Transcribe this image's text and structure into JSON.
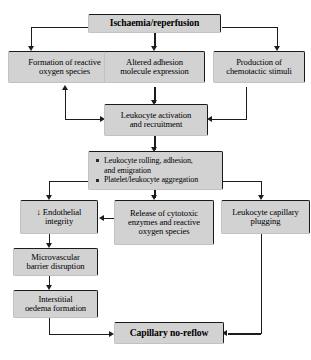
{
  "diagram": {
    "colors": {
      "box_fill": "#d2d2d2",
      "box_edge": "#1a1a1a",
      "connector": "#1c1c1c",
      "background": "#ffffff"
    },
    "nodes": {
      "ischaemia": {
        "label": "Ischaemia/reperfusion"
      },
      "reactive_oxygen": {
        "line1": "Formation of reactive",
        "line2": "oxygen species"
      },
      "adhesion": {
        "line1": "Altered adhesion",
        "line2": "molecule expression"
      },
      "chemotactic": {
        "line1": "Production of",
        "line2": "chemotactic stimuli"
      },
      "leukocyte_activation": {
        "line1": "Leukocyte activation",
        "line2": "and recruitment"
      },
      "rolling": {
        "bullets": [
          "Leukocyte rolling, adhesion,",
          "and emigration",
          "Platelet/leukocyte aggregation"
        ],
        "bullet_items": [
          {
            "line1": "Leukocyte rolling, adhesion,",
            "line2": "and emigration"
          },
          {
            "line1": "Platelet/leukocyte aggregation",
            "line2": ""
          }
        ]
      },
      "endothelial": {
        "line1": "↓ Endothelial",
        "line2": "integrity"
      },
      "cytotoxic": {
        "line1": "Release of cytotoxic",
        "line2": "enzymes and reactive",
        "line3": "oxygen species"
      },
      "plugging": {
        "line1": "Leukocyte capillary",
        "line2": "plugging"
      },
      "microvascular": {
        "line1": "Microvascular",
        "line2": "barrier disruption"
      },
      "interstitial": {
        "line1": "Interstitial",
        "line2": "oedema formation"
      },
      "noreflow": {
        "label": "Capillary no-reflow"
      }
    }
  }
}
